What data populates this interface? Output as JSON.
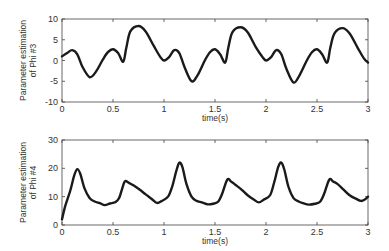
{
  "chart_data": [
    {
      "type": "line",
      "title": "",
      "xlabel": "time(s)",
      "ylabel": "Parameter estimation of Phi #3",
      "ylabel_lines": [
        "Parameter estimation",
        "of Phi #3"
      ],
      "xlim": [
        0,
        3
      ],
      "ylim": [
        -10,
        10
      ],
      "xticks": [
        0,
        0.5,
        1,
        1.5,
        2,
        2.5,
        3
      ],
      "xtick_labels": [
        "0",
        "0.5",
        "1",
        "1.5",
        "2",
        "2.5",
        "3"
      ],
      "yticks": [
        -10,
        -5,
        0,
        5,
        10
      ],
      "ytick_labels": [
        "-10",
        "-5",
        "0",
        "5",
        "10"
      ],
      "grid": false,
      "legend": null,
      "series": [
        {
          "name": "Phi #3",
          "x": [
            0,
            0.05,
            0.1,
            0.15,
            0.2,
            0.27,
            0.33,
            0.4,
            0.45,
            0.5,
            0.55,
            0.6,
            0.63,
            0.67,
            0.75,
            0.82,
            0.9,
            0.96,
            1.0,
            1.05,
            1.1,
            1.15,
            1.2,
            1.27,
            1.33,
            1.4,
            1.45,
            1.5,
            1.55,
            1.6,
            1.63,
            1.67,
            1.75,
            1.82,
            1.9,
            1.96,
            2.0,
            2.05,
            2.1,
            2.15,
            2.2,
            2.27,
            2.33,
            2.4,
            2.45,
            2.5,
            2.55,
            2.6,
            2.63,
            2.67,
            2.75,
            2.82,
            2.9,
            2.96,
            3.0
          ],
          "y": [
            1.0,
            1.8,
            2.5,
            1.5,
            -1.5,
            -4.0,
            -2.8,
            0.2,
            2.0,
            2.7,
            1.8,
            -0.3,
            3.0,
            7.0,
            8.3,
            7.0,
            3.5,
            1.0,
            0.0,
            0.8,
            2.5,
            1.8,
            -1.5,
            -5.0,
            -3.5,
            0.0,
            2.0,
            2.7,
            1.5,
            -0.5,
            3.0,
            6.8,
            8.0,
            6.8,
            3.2,
            1.0,
            0.0,
            0.8,
            2.5,
            1.5,
            -2.0,
            -5.3,
            -3.5,
            0.0,
            2.0,
            2.7,
            1.5,
            -0.5,
            3.0,
            6.5,
            7.8,
            6.5,
            3.0,
            0.5,
            -0.5
          ]
        }
      ]
    },
    {
      "type": "line",
      "title": "",
      "xlabel": "time(s)",
      "ylabel": "Parameter estimation of Phi #4",
      "ylabel_lines": [
        "Parameter estimation",
        "of Phi #4"
      ],
      "xlim": [
        0,
        3
      ],
      "ylim": [
        0,
        30
      ],
      "xticks": [
        0,
        0.5,
        1,
        1.5,
        2,
        2.5,
        3
      ],
      "xtick_labels": [
        "0",
        "0.5",
        "1",
        "1.5",
        "2",
        "2.5",
        "3"
      ],
      "yticks": [
        0,
        10,
        20,
        30
      ],
      "ytick_labels": [
        "0",
        "10",
        "20",
        "30"
      ],
      "grid": false,
      "legend": null,
      "series": [
        {
          "name": "Phi #4",
          "x": [
            0,
            0.03,
            0.08,
            0.12,
            0.15,
            0.18,
            0.22,
            0.27,
            0.32,
            0.37,
            0.42,
            0.47,
            0.52,
            0.56,
            0.6,
            0.62,
            0.66,
            0.7,
            0.76,
            0.82,
            0.88,
            0.93,
            0.98,
            1.04,
            1.08,
            1.12,
            1.15,
            1.18,
            1.22,
            1.27,
            1.32,
            1.37,
            1.43,
            1.48,
            1.53,
            1.57,
            1.62,
            1.66,
            1.7,
            1.76,
            1.82,
            1.88,
            1.93,
            1.98,
            2.04,
            2.08,
            2.12,
            2.15,
            2.18,
            2.22,
            2.27,
            2.32,
            2.37,
            2.42,
            2.48,
            2.53,
            2.57,
            2.62,
            2.66,
            2.7,
            2.76,
            2.82,
            2.88,
            2.93,
            2.97,
            3.0
          ],
          "y": [
            2.0,
            6.5,
            12.0,
            17.5,
            19.7,
            18.0,
            13.0,
            9.5,
            8.3,
            7.7,
            7.0,
            7.6,
            8.0,
            9.5,
            14.0,
            15.5,
            14.8,
            14.0,
            12.5,
            10.8,
            9.2,
            7.8,
            8.5,
            10.0,
            13.5,
            19.0,
            22.0,
            20.5,
            14.5,
            10.0,
            8.5,
            8.0,
            7.3,
            7.5,
            8.2,
            11.0,
            16.0,
            15.3,
            14.2,
            12.5,
            10.5,
            9.0,
            8.0,
            9.0,
            10.5,
            15.0,
            20.5,
            22.0,
            19.5,
            13.5,
            9.5,
            8.3,
            7.6,
            7.2,
            7.5,
            8.2,
            11.0,
            16.0,
            15.3,
            14.5,
            12.5,
            10.5,
            9.3,
            8.5,
            9.0,
            10.0
          ]
        }
      ]
    }
  ]
}
